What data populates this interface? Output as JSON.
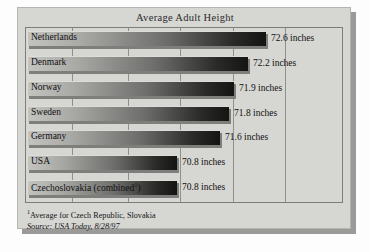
{
  "chart_data": {
    "type": "bar",
    "orientation": "horizontal",
    "title": "Average Adult Height",
    "xlabel": "",
    "ylabel": "",
    "unit": "inches",
    "categories": [
      "Netherlands",
      "Denmark",
      "Norway",
      "Sweden",
      "Germany",
      "USA",
      "Czechoslovakia (combined¹)"
    ],
    "values": [
      72.6,
      72.2,
      71.9,
      71.8,
      71.6,
      70.8,
      70.8
    ],
    "value_labels": [
      "72.6 inches",
      "72.2 inches",
      "71.9 inches",
      "71.8 inches",
      "71.6 inches",
      "70.8 inches",
      "70.8 inches"
    ],
    "bar_fractions": [
      0.755,
      0.7,
      0.655,
      0.638,
      0.61,
      0.475,
      0.475
    ],
    "gridline_fractions": [
      0.145,
      0.322,
      0.487,
      0.655,
      0.82
    ],
    "xlim": [
      70.0,
      73.4
    ],
    "grid": true,
    "legend": false,
    "bar_gradient_from": "#c3c3c0",
    "bar_gradient_to": "#141412",
    "panel_color": "#d6d6d3",
    "frame_color": "#7d7d7b"
  },
  "footnotes": {
    "marker": "1",
    "note": "Average for Czech Republic, Slovakia",
    "source": "Source: USA Today, 8/28/97"
  }
}
